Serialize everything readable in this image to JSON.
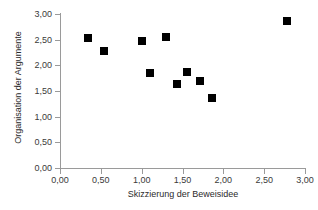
{
  "chart_data": {
    "type": "scatter",
    "title": "",
    "xlabel": "Skizzierung der Beweisidee",
    "ylabel": "Organisation der Argumente",
    "xlim": [
      0,
      3
    ],
    "ylim": [
      0,
      3
    ],
    "grid": false,
    "legend": false,
    "xticks": [
      "0,00",
      "0,50",
      "1,00",
      "1,50",
      "2,00",
      "2,50",
      "3,00"
    ],
    "xtick_values": [
      0,
      0.5,
      1.0,
      1.5,
      2.0,
      2.5,
      3.0
    ],
    "yticks": [
      "0,00",
      "0,50",
      "1,00",
      "1,50",
      "2,00",
      "2,50",
      "3,00"
    ],
    "ytick_values": [
      0,
      0.5,
      1.0,
      1.5,
      2.0,
      2.5,
      3.0
    ],
    "marker_color": "#000000",
    "marker_shape": "square",
    "points": [
      {
        "x": 0.34,
        "y": 2.54
      },
      {
        "x": 0.54,
        "y": 2.28
      },
      {
        "x": 1.0,
        "y": 2.48
      },
      {
        "x": 1.1,
        "y": 1.85
      },
      {
        "x": 1.3,
        "y": 2.55
      },
      {
        "x": 1.43,
        "y": 1.64
      },
      {
        "x": 1.55,
        "y": 1.87
      },
      {
        "x": 1.71,
        "y": 1.7
      },
      {
        "x": 1.86,
        "y": 1.36
      },
      {
        "x": 2.78,
        "y": 2.86
      }
    ]
  },
  "axes": {
    "line_color": "#9a9a9a",
    "text_color": "#3a3a3a"
  }
}
